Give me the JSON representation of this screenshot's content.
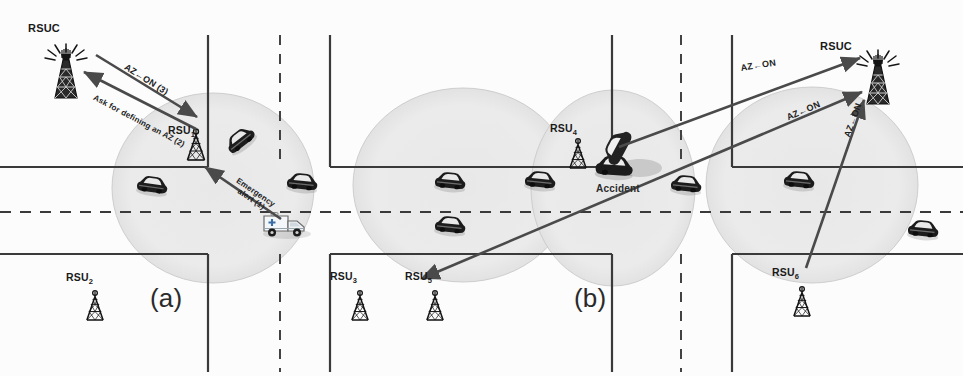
{
  "figure": {
    "panels": [
      {
        "id": "panel-a",
        "label": "(a)",
        "x": 150,
        "y": 283
      },
      {
        "id": "panel-b",
        "label": "(b)",
        "x": 574,
        "y": 283
      }
    ]
  },
  "colors": {
    "background": "#fcfcfc",
    "road_line": "#3a3a3a",
    "coverage_fill": "#ebebeb",
    "coverage_stroke": "#c9c9c9",
    "arrow": "#4a4a4a",
    "text": "#1a1a1a",
    "vehicle_dark": "#1c1c1c",
    "vehicle_light": "#f2f2f2",
    "accident_smoke": "#c0c0c0",
    "ambulance_body": "#eef2f4",
    "ambulance_cross": "#3b6fa8"
  },
  "nodes": {
    "rsuc": [
      {
        "name": "rsuc-left",
        "label": "RSUC",
        "label_x": 28,
        "label_y": 22,
        "tower_x": 66,
        "tower_y": 40,
        "scale": 1.0,
        "broadcasting": true
      },
      {
        "name": "rsuc-right",
        "label": "RSUC",
        "label_x": 820,
        "label_y": 40,
        "tower_x": 878,
        "tower_y": 46,
        "scale": 1.0,
        "broadcasting": true
      }
    ],
    "rsus": [
      {
        "name": "rsu-1",
        "label": "RSU",
        "sub": "1",
        "label_x": 168,
        "label_y": 124,
        "tower_x": 196,
        "tower_y": 118,
        "scale": 0.95
      },
      {
        "name": "rsu-2",
        "label": "RSU",
        "sub": "2",
        "label_x": 66,
        "label_y": 271,
        "tower_x": 95,
        "tower_y": 278,
        "scale": 0.9
      },
      {
        "name": "rsu-3",
        "label": "RSU",
        "sub": "3",
        "label_x": 330,
        "label_y": 270,
        "tower_x": 360,
        "tower_y": 278,
        "scale": 0.9
      },
      {
        "name": "rsu-4",
        "label": "RSU",
        "sub": "4",
        "label_x": 550,
        "label_y": 122,
        "tower_x": 578,
        "tower_y": 126,
        "scale": 0.9
      },
      {
        "name": "rsu-5",
        "label": "RSU",
        "sub": "5",
        "label_x": 405,
        "label_y": 270,
        "tower_x": 435,
        "tower_y": 278,
        "scale": 0.9
      },
      {
        "name": "rsu-6",
        "label": "RSU",
        "sub": "6",
        "label_x": 772,
        "label_y": 266,
        "tower_x": 802,
        "tower_y": 274,
        "scale": 0.9
      }
    ]
  },
  "coverage_zones": [
    {
      "name": "coverage-rsu1",
      "cx": 213,
      "cy": 188,
      "rx": 101,
      "ry": 95
    },
    {
      "name": "coverage-rsu5",
      "cx": 463,
      "cy": 185,
      "rx": 110,
      "ry": 97
    },
    {
      "name": "coverage-rsu4",
      "cx": 613,
      "cy": 188,
      "rx": 82,
      "ry": 98
    },
    {
      "name": "coverage-rsu6",
      "cx": 812,
      "cy": 185,
      "rx": 106,
      "ry": 98
    }
  ],
  "arrows": [
    {
      "name": "arrow-az-on-3",
      "x1": 96,
      "y1": 55,
      "x2": 197,
      "y2": 117,
      "label": "AZ←ON (3)",
      "label_x": 128,
      "label_y": 62,
      "angle": 32,
      "head": "end"
    },
    {
      "name": "arrow-ask-define-az-2",
      "x1": 196,
      "y1": 129,
      "x2": 84,
      "y2": 72,
      "label": "Ask for defining an AZ (2)",
      "label_x": 96,
      "label_y": 93,
      "angle": 28,
      "head": "end"
    },
    {
      "name": "arrow-emergency-alert-1",
      "x1": 281,
      "y1": 219,
      "x2": 205,
      "y2": 167,
      "label": "Emergency\nalert (1)",
      "label_x": 239,
      "label_y": 177,
      "angle": 34,
      "head": "end"
    },
    {
      "name": "arrow-az-on-right-top",
      "x1": 619,
      "y1": 147,
      "x2": 860,
      "y2": 58,
      "label": "AZ←ON",
      "label_x": 740,
      "label_y": 63,
      "angle": -9,
      "head": "end"
    },
    {
      "name": "arrow-az-on-right-mid",
      "x1": 437,
      "y1": 272,
      "x2": 862,
      "y2": 92,
      "label": "AZ←ON",
      "label_x": 785,
      "label_y": 113,
      "angle": -23,
      "head": "both"
    },
    {
      "name": "arrow-az-on-right-low",
      "x1": 806,
      "y1": 268,
      "x2": 864,
      "y2": 100,
      "label": "AZ←ON",
      "label_x": 842,
      "label_y": 135,
      "angle": -70,
      "head": "end"
    }
  ],
  "annotations": [
    {
      "name": "accident-label",
      "label": "Accident",
      "x": 596,
      "y": 183
    }
  ],
  "vehicles": [
    {
      "name": "vehicle-1",
      "x": 152,
      "y": 188,
      "rot": 8,
      "tone": "dark"
    },
    {
      "name": "vehicle-2",
      "x": 242,
      "y": 142,
      "rot": -38,
      "tone": "dark"
    },
    {
      "name": "vehicle-3",
      "x": 302,
      "y": 185,
      "rot": 6,
      "tone": "dark"
    },
    {
      "name": "vehicle-4",
      "x": 450,
      "y": 184,
      "rot": 6,
      "tone": "dark"
    },
    {
      "name": "vehicle-5",
      "x": 450,
      "y": 228,
      "rot": 6,
      "tone": "dark"
    },
    {
      "name": "vehicle-6",
      "x": 540,
      "y": 183,
      "rot": 6,
      "tone": "dark"
    },
    {
      "name": "vehicle-7",
      "x": 686,
      "y": 187,
      "rot": 6,
      "tone": "dark"
    },
    {
      "name": "vehicle-8",
      "x": 799,
      "y": 183,
      "rot": 6,
      "tone": "dark"
    },
    {
      "name": "vehicle-9",
      "x": 923,
      "y": 232,
      "rot": 6,
      "tone": "dark"
    }
  ],
  "crash": {
    "name": "accident-vehicles",
    "x": 618,
    "y": 160
  },
  "ambulance": {
    "name": "ambulance",
    "x": 285,
    "y": 222
  },
  "roads": {
    "horizontal_main": {
      "y_top": 167,
      "y_bottom": 254,
      "dash_y": 212
    },
    "vertical_segments": [
      {
        "x": 208,
        "from": 35,
        "to": 167
      },
      {
        "x": 208,
        "from": 254,
        "to": 372
      },
      {
        "x": 280,
        "from": 35,
        "to": 167,
        "dashed": true
      },
      {
        "x": 280,
        "from": 254,
        "to": 372,
        "dashed": true
      },
      {
        "x": 330,
        "from": 35,
        "to": 167
      },
      {
        "x": 330,
        "from": 254,
        "to": 372
      },
      {
        "x": 612,
        "from": 35,
        "to": 167
      },
      {
        "x": 612,
        "from": 254,
        "to": 372
      },
      {
        "x": 681,
        "from": 35,
        "to": 167,
        "dashed": true
      },
      {
        "x": 681,
        "from": 254,
        "to": 372,
        "dashed": true
      },
      {
        "x": 732,
        "from": 35,
        "to": 167
      },
      {
        "x": 732,
        "from": 254,
        "to": 372
      }
    ]
  }
}
